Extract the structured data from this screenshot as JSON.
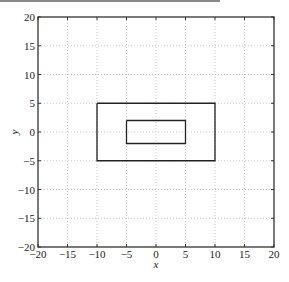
{
  "chart_data": {
    "type": "line",
    "title": "",
    "xlabel": "x",
    "ylabel": "y",
    "xlim": [
      -20,
      20
    ],
    "ylim": [
      -20,
      20
    ],
    "grid": true,
    "grid_style": "dotted",
    "legend": null,
    "x_ticks": [
      -20,
      -15,
      -10,
      -5,
      0,
      5,
      10,
      15,
      20
    ],
    "y_ticks": [
      -20,
      -15,
      -10,
      -5,
      0,
      5,
      10,
      15,
      20
    ],
    "x_tick_labels": [
      "−20",
      "−15",
      "−10",
      "−5",
      "0",
      "5",
      "10",
      "15",
      "20"
    ],
    "y_tick_labels": [
      "−20",
      "−15",
      "−10",
      "−5",
      "0",
      "5",
      "10",
      "15",
      "20"
    ],
    "series": [
      {
        "name": "outer-rectangle",
        "color": "#222222",
        "x": [
          -10,
          10,
          10,
          -10,
          -10
        ],
        "y": [
          5,
          5,
          -5,
          -5,
          5
        ]
      },
      {
        "name": "inner-rectangle",
        "color": "#222222",
        "x": [
          -5,
          5,
          5,
          -5,
          -5
        ],
        "y": [
          2,
          2,
          -2,
          -2,
          2
        ]
      }
    ]
  },
  "labels": {
    "xlabel": "x",
    "ylabel": "y"
  }
}
